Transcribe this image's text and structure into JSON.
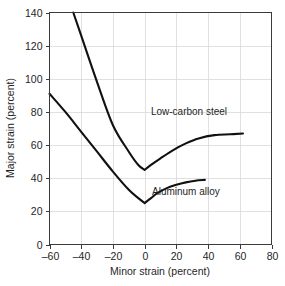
{
  "chart_data": {
    "type": "line",
    "title": "",
    "subtitle": "",
    "xlabel": "Minor strain (percent)",
    "ylabel": "Major strain (percent)",
    "xlim": [
      -60,
      80
    ],
    "ylim": [
      0,
      140
    ],
    "xticks": [
      -60,
      -40,
      -20,
      0,
      20,
      40,
      60,
      80
    ],
    "xtick_labels": [
      "–60",
      "–40",
      "–20",
      "0",
      "20",
      "40",
      "60",
      "80"
    ],
    "yticks": [
      0,
      20,
      40,
      60,
      80,
      100,
      120,
      140
    ],
    "ytick_labels": [
      "0",
      "20",
      "40",
      "60",
      "80",
      "100",
      "120",
      "140"
    ],
    "grid": true,
    "legend": "inline-annotations",
    "series": [
      {
        "name": "Low-carbon steel",
        "label": "Low-carbon steel",
        "color": "#111111",
        "label_x": 28,
        "label_y": 78,
        "points": [
          [
            -45,
            140
          ],
          [
            -40,
            126
          ],
          [
            -30,
            98
          ],
          [
            -20,
            72
          ],
          [
            -10,
            56
          ],
          [
            -4,
            48
          ],
          [
            0,
            45
          ],
          [
            4,
            48
          ],
          [
            10,
            52
          ],
          [
            18,
            57
          ],
          [
            26,
            61
          ],
          [
            34,
            64
          ],
          [
            44,
            66
          ],
          [
            54,
            66.5
          ],
          [
            62,
            67
          ]
        ]
      },
      {
        "name": "Aluminum alloy",
        "label": "Aluminum alloy",
        "color": "#111111",
        "label_x": 26,
        "label_y": 30,
        "points": [
          [
            -60,
            91
          ],
          [
            -50,
            80
          ],
          [
            -40,
            68
          ],
          [
            -30,
            56
          ],
          [
            -20,
            44
          ],
          [
            -10,
            33
          ],
          [
            -4,
            28
          ],
          [
            0,
            25
          ],
          [
            4,
            28
          ],
          [
            8,
            31
          ],
          [
            14,
            34
          ],
          [
            20,
            36
          ],
          [
            26,
            37.5
          ],
          [
            32,
            38.5
          ],
          [
            38,
            39
          ]
        ]
      }
    ]
  },
  "figure": {
    "background_color": "#ffffff",
    "grid_color": "#d8d8d8",
    "axis_color": "#3a3a3a",
    "curve_color": "#111111"
  }
}
